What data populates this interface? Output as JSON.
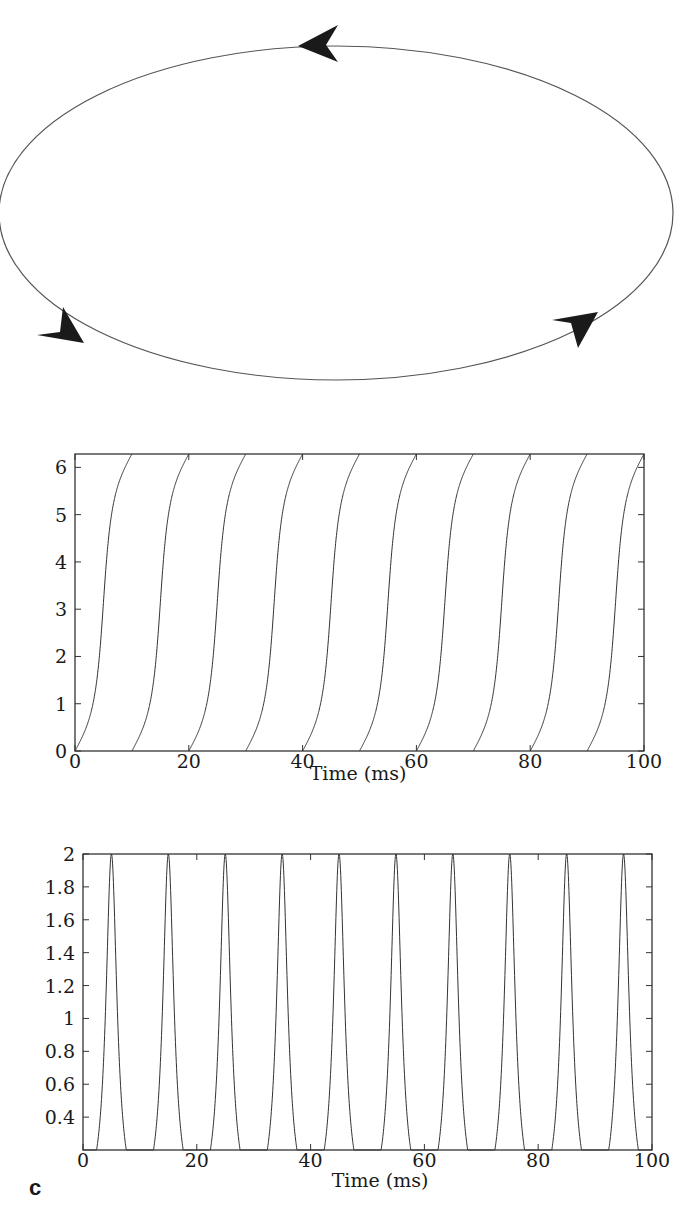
{
  "figure": {
    "panel_label": "c"
  },
  "chart_data": [
    {
      "type": "diagram",
      "description": "Limit cycle: closed elliptical orbit with three arrowheads indicating counter-clockwise flow",
      "arrows": [
        {
          "position": "top",
          "direction": "left"
        },
        {
          "position": "bottom-left",
          "direction": "down-right"
        },
        {
          "position": "bottom-right",
          "direction": "up-right"
        }
      ],
      "line_color": "#555555",
      "arrow_color": "#1a1a1a"
    },
    {
      "type": "line",
      "title": "",
      "xlabel": "Time (ms)",
      "ylabel": "",
      "xlim": [
        0,
        100
      ],
      "ylim": [
        0,
        6.2832
      ],
      "xticks": [
        0,
        20,
        40,
        60,
        80,
        100
      ],
      "xtick_labels": [
        "0",
        "20",
        "40",
        "60",
        "80",
        "100"
      ],
      "yticks": [
        0,
        1,
        2,
        3,
        4,
        5,
        6
      ],
      "ytick_labels": [
        "0",
        "1",
        "2",
        "3",
        "4",
        "5",
        "6"
      ],
      "grid": false,
      "legend": null,
      "series": [
        {
          "name": "phase theta(t) (wraps 0 to 2pi)",
          "period_ms": 10,
          "steepness": 2.8,
          "cycle_starts_ms": [
            0,
            10,
            20,
            30,
            40,
            50,
            60,
            70,
            80,
            90
          ],
          "values_at_cycle_start": 0,
          "values_at_cycle_mid": 3.1416,
          "values_at_cycle_end": 6.2832
        }
      ]
    },
    {
      "type": "line",
      "title": "",
      "xlabel": "Time (ms)",
      "ylabel": "",
      "xlim": [
        0,
        100
      ],
      "ylim": [
        0.2,
        2
      ],
      "xticks": [
        0,
        20,
        40,
        60,
        80,
        100
      ],
      "xtick_labels": [
        "0",
        "20",
        "40",
        "60",
        "80",
        "100"
      ],
      "yticks": [
        0.4,
        0.6,
        0.8,
        1,
        1.2,
        1.4,
        1.6,
        1.8,
        2
      ],
      "ytick_labels": [
        "0.4",
        "0.6",
        "0.8",
        "1",
        "1.2",
        "1.4",
        "1.6",
        "1.8",
        "2"
      ],
      "grid": false,
      "legend": null,
      "series": [
        {
          "name": "1 - cos(theta(t))",
          "period_ms": 10,
          "steepness": 2.8,
          "peak_times_ms": [
            5,
            15,
            25,
            35,
            45,
            55,
            65,
            75,
            85,
            95
          ],
          "peak_value": 2,
          "trough_times_ms": [
            0,
            10,
            20,
            30,
            40,
            50,
            60,
            70,
            80,
            90,
            100
          ],
          "trough_value": 0
        }
      ]
    }
  ]
}
